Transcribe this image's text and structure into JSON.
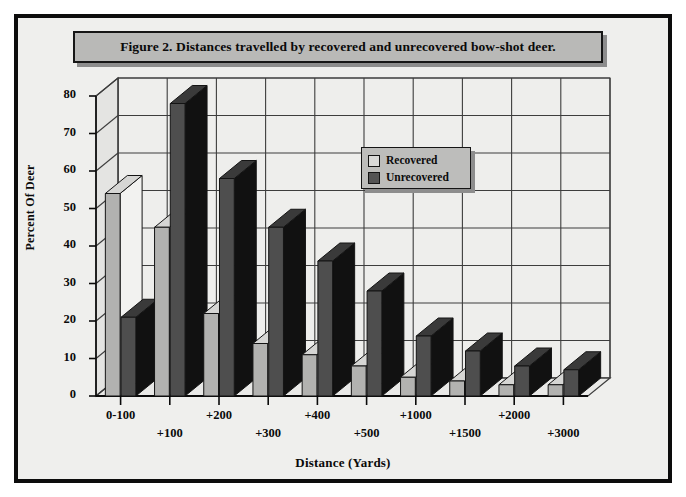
{
  "figure": {
    "title": "Figure 2. Distances travelled by recovered and unrecovered bow-shot deer."
  },
  "legend": {
    "items": [
      {
        "label": "Recovered",
        "swatch": "#d9d9d7"
      },
      {
        "label": "Unrecovered",
        "swatch": "#545454"
      }
    ]
  },
  "colors": {
    "background": "#efefed",
    "frame": "#0c0c0c",
    "banner_fill": "#b9b9b7",
    "recovered_front": "#b2b2b0",
    "recovered_top": "#d6d6d4",
    "recovered_side": "#f2f2f0",
    "unrecovered_front": "#4e4e4e",
    "unrecovered_top": "#3a3a3a",
    "unrecovered_side": "#111111",
    "gridline": "#3d3d3d",
    "wall": "#eeeeec"
  },
  "chart_data": {
    "type": "bar",
    "title": "Figure 2. Distances travelled by recovered and unrecovered bow-shot deer.",
    "xlabel": "Distance (Yards)",
    "ylabel": "Percent Of Deer",
    "categories": [
      "0-100",
      "+100",
      "+200",
      "+300",
      "+400",
      "+500",
      "+1000",
      "+1500",
      "+2000",
      "+3000"
    ],
    "series": [
      {
        "name": "Recovered",
        "values": [
          54,
          45,
          22,
          14,
          11,
          8,
          5,
          4,
          3,
          3
        ]
      },
      {
        "name": "Unrecovered",
        "values": [
          21,
          78,
          58,
          45,
          36,
          28,
          16,
          12,
          8,
          7
        ]
      }
    ],
    "ylim": [
      0,
      80
    ],
    "yticks": [
      "0",
      "10",
      "20",
      "30",
      "40",
      "50",
      "60",
      "70",
      "80"
    ],
    "grid": true,
    "legend_position": "inside-upper-center",
    "style": "3d-clustered-column"
  }
}
